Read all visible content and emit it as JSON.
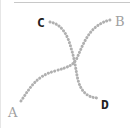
{
  "diagram": {
    "labels": {
      "A": "A",
      "B": "B",
      "C": "C",
      "D": "D"
    },
    "colors": {
      "dots": "#b0b0b0",
      "label_gray": "#a0a0a0",
      "label_dark": "#222222"
    },
    "paths": [
      {
        "from": "A",
        "to": "B",
        "style": "dotted"
      },
      {
        "from": "C",
        "to": "D",
        "style": "dotted"
      }
    ]
  }
}
